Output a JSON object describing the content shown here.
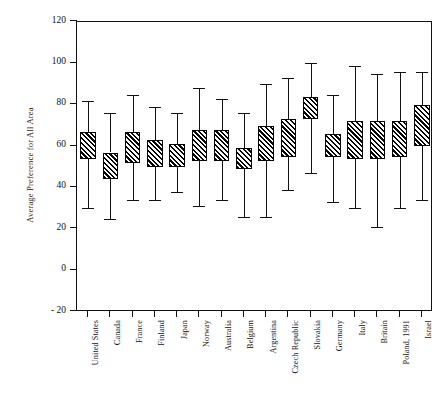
{
  "chart_data": {
    "type": "box",
    "title": "",
    "xlabel": "",
    "ylabel": "Average Preference for All Area",
    "ylim": [
      -20,
      120
    ],
    "yticks": [
      120,
      100,
      80,
      60,
      40,
      20,
      0,
      -20
    ],
    "ytick_labels": [
      "120",
      "100",
      "80",
      "60",
      "40",
      "20",
      "0",
      "- 20"
    ],
    "grid": false,
    "legend": null,
    "categories": [
      "United States",
      "Canada",
      "France",
      "Finland",
      "Japan",
      "Norway",
      "Australia",
      "Belgium",
      "Argentina",
      "Czech Republic",
      "Slovakia",
      "Germany",
      "Italy",
      "Britain",
      "Poland, 1991",
      "Israel"
    ],
    "boxes": [
      {
        "category": "United States",
        "whisker_low": 30,
        "q1": 54,
        "q3": 67,
        "whisker_high": 82
      },
      {
        "category": "Canada",
        "whisker_low": 25,
        "q1": 44,
        "q3": 57,
        "whisker_high": 76
      },
      {
        "category": "France",
        "whisker_low": 34,
        "q1": 52,
        "q3": 67,
        "whisker_high": 85
      },
      {
        "category": "Finland",
        "whisker_low": 34,
        "q1": 50,
        "q3": 63,
        "whisker_high": 79
      },
      {
        "category": "Japan",
        "whisker_low": 38,
        "q1": 50,
        "q3": 61,
        "whisker_high": 76
      },
      {
        "category": "Norway",
        "whisker_low": 31,
        "q1": 53,
        "q3": 68,
        "whisker_high": 88
      },
      {
        "category": "Australia",
        "whisker_low": 34,
        "q1": 53,
        "q3": 68,
        "whisker_high": 83
      },
      {
        "category": "Belgium",
        "whisker_low": 26,
        "q1": 49,
        "q3": 59,
        "whisker_high": 76
      },
      {
        "category": "Argentina",
        "whisker_low": 26,
        "q1": 53,
        "q3": 70,
        "whisker_high": 90
      },
      {
        "category": "Czech Republic",
        "whisker_low": 39,
        "q1": 55,
        "q3": 73,
        "whisker_high": 93
      },
      {
        "category": "Slovakia",
        "whisker_low": 47,
        "q1": 73,
        "q3": 84,
        "whisker_high": 100
      },
      {
        "category": "Germany",
        "whisker_low": 33,
        "q1": 55,
        "q3": 66,
        "whisker_high": 85
      },
      {
        "category": "Italy",
        "whisker_low": 30,
        "q1": 54,
        "q3": 72,
        "whisker_high": 99
      },
      {
        "category": "Britain",
        "whisker_low": 21,
        "q1": 54,
        "q3": 72,
        "whisker_high": 95
      },
      {
        "category": "Poland, 1991",
        "whisker_low": 30,
        "q1": 55,
        "q3": 72,
        "whisker_high": 96
      },
      {
        "category": "Israel",
        "whisker_low": 34,
        "q1": 60,
        "q3": 80,
        "whisker_high": 96
      }
    ]
  }
}
